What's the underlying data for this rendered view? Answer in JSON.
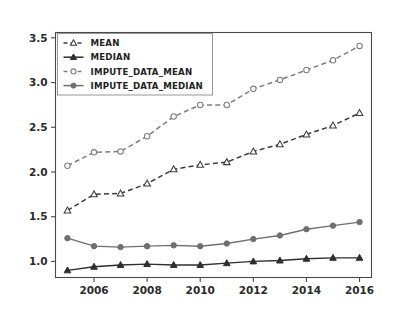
{
  "chart_data": {
    "type": "line",
    "title": "",
    "xlabel": "",
    "ylabel": "",
    "x": [
      2005,
      2006,
      2007,
      2008,
      2009,
      2010,
      2011,
      2012,
      2013,
      2014,
      2015,
      2016
    ],
    "xticks": [
      2006,
      2008,
      2010,
      2012,
      2014,
      2016
    ],
    "xtick_labels": [
      "2006",
      "2008",
      "2010",
      "2012",
      "2014",
      "2016"
    ],
    "yticks": [
      1.0,
      1.5,
      2.0,
      2.5,
      3.0,
      3.5
    ],
    "ytick_labels": [
      "1.0",
      "1.5",
      "2.0",
      "2.5",
      "3.0",
      "3.5"
    ],
    "xlim": [
      2004.55,
      2016.45
    ],
    "ylim": [
      0.82,
      3.56
    ],
    "grid": false,
    "legend_position": "upper left",
    "series": [
      {
        "name": "MEAN",
        "style": "dashed",
        "marker": "triangle-open",
        "color": "#3a3a3a",
        "values": [
          1.57,
          1.75,
          1.76,
          1.87,
          2.03,
          2.08,
          2.11,
          2.23,
          2.31,
          2.42,
          2.52,
          2.66
        ]
      },
      {
        "name": "MEDIAN",
        "style": "solid",
        "marker": "triangle-filled",
        "color": "#2e2e2e",
        "values": [
          0.9,
          0.94,
          0.96,
          0.97,
          0.96,
          0.96,
          0.98,
          1.0,
          1.01,
          1.03,
          1.04,
          1.04
        ]
      },
      {
        "name": "IMPUTE_DATA_MEAN",
        "style": "dashed",
        "marker": "circle-open",
        "color": "#7d7d7d",
        "values": [
          2.07,
          2.22,
          2.23,
          2.4,
          2.62,
          2.75,
          2.75,
          2.93,
          3.03,
          3.14,
          3.25,
          3.41
        ]
      },
      {
        "name": "IMPUTE_DATA_MEDIAN",
        "style": "solid",
        "marker": "circle-filled",
        "color": "#6f6f6f",
        "values": [
          1.26,
          1.17,
          1.16,
          1.17,
          1.18,
          1.17,
          1.2,
          1.25,
          1.29,
          1.36,
          1.4,
          1.44
        ]
      }
    ]
  },
  "legend": {
    "entries": [
      {
        "label": "MEAN"
      },
      {
        "label": "MEDIAN"
      },
      {
        "label": "IMPUTE_DATA_MEAN"
      },
      {
        "label": "IMPUTE_DATA_MEDIAN"
      }
    ]
  },
  "axes": {
    "y_tick_texts": [
      "3.5",
      "3.0",
      "2.5",
      "2.0",
      "1.5",
      "1.0"
    ],
    "x_tick_texts": [
      "2006",
      "2008",
      "2010",
      "2012",
      "2014",
      "2016"
    ]
  }
}
